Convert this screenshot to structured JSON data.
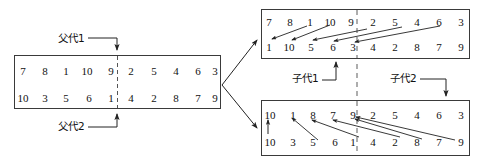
{
  "diagram": {
    "type": "crossover-diagram",
    "colors": {
      "stroke": "#3a3a3a",
      "text": "#111111",
      "dashed": "#555555",
      "background": "#ffffff"
    },
    "labels": {
      "parent1": "父代1",
      "parent2": "父代2",
      "child1": "子代1",
      "child2": "子代2"
    },
    "parent_box": {
      "name": "parent-chromosome-box",
      "crossover_point_index": 5,
      "rows": [
        {
          "name": "parent1-row",
          "left": [
            "7",
            "8",
            "1",
            "10",
            "9"
          ],
          "right": [
            "2",
            "5",
            "4",
            "6",
            "3"
          ]
        },
        {
          "name": "parent2-row",
          "left": [
            "10",
            "3",
            "5",
            "6",
            "1"
          ],
          "right": [
            "4",
            "2",
            "8",
            "7",
            "9"
          ]
        }
      ]
    },
    "child1_box": {
      "name": "child1-chromosome-box",
      "crossover_point_index": 5,
      "rows": [
        {
          "name": "child1-top-row",
          "left": [
            "7",
            "8",
            "1",
            "10",
            "9"
          ],
          "right": [
            "2",
            "5",
            "4",
            "6",
            "3"
          ]
        },
        {
          "name": "child1-bottom-row",
          "left": [
            "1",
            "10",
            "5",
            "6",
            "3"
          ],
          "right": [
            "4",
            "2",
            "8",
            "7",
            "9"
          ]
        }
      ]
    },
    "child2_box": {
      "name": "child2-chromosome-box",
      "crossover_point_index": 5,
      "lead_value": "10",
      "rows": [
        {
          "name": "child2-top-row",
          "left": [
            "1",
            "8",
            "7",
            "9"
          ],
          "right": [
            "2",
            "5",
            "4",
            "6",
            "3"
          ]
        },
        {
          "name": "child2-bottom-row",
          "left": [
            "3",
            "5",
            "6",
            "1"
          ],
          "right": [
            "4",
            "2",
            "8",
            "7",
            "9"
          ]
        }
      ],
      "bottom_lead_value": "10"
    }
  }
}
